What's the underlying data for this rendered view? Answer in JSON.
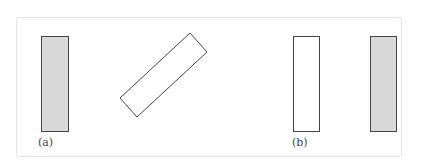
{
  "figure": {
    "panels": [
      {
        "id": "a",
        "label": "(a)",
        "shapes": [
          {
            "type": "rect",
            "fill": "#d8d8d8",
            "orientation": "vertical"
          },
          {
            "type": "rect",
            "fill": "#ffffff",
            "orientation": "rotated-45"
          }
        ]
      },
      {
        "id": "b",
        "label": "(b)",
        "shapes": [
          {
            "type": "rect",
            "fill": "#ffffff",
            "orientation": "vertical"
          },
          {
            "type": "rect",
            "fill": "#d8d8d8",
            "orientation": "vertical"
          }
        ]
      }
    ],
    "colors": {
      "stroke": "#444444",
      "shaded": "#d8d8d8",
      "frame": "#e4e4e4"
    }
  }
}
